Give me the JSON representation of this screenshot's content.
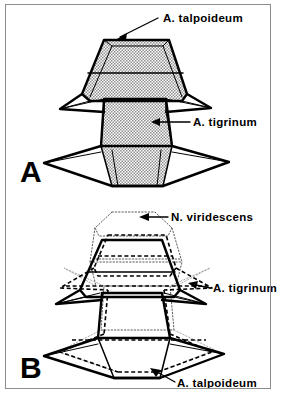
{
  "figure": {
    "title_visible": false,
    "background_color": "#ffffff",
    "ink_color": "#000000",
    "frame_color": "#8c8c8c",
    "shade_fill": "#b9b9b9"
  },
  "panels": [
    {
      "id": "A",
      "letter": "A",
      "description": "Shaded three-dimensional polyhedral niche volumes",
      "labels": [
        {
          "name": "a-talpoideum",
          "text": "A. talpoideum",
          "x": 163,
          "y": 22,
          "anchor": "start",
          "leader_from": [
            158,
            18
          ],
          "leader_to": [
            118,
            38
          ]
        },
        {
          "name": "a-tigrinum",
          "text": "A. tigrinum",
          "x": 193,
          "y": 126,
          "anchor": "start",
          "leader_from": [
            190,
            122
          ],
          "leader_to": [
            152,
            122
          ]
        }
      ]
    },
    {
      "id": "B",
      "letter": "B",
      "description": "Overlapping wireframe niche volumes drawn in solid, dashed and dotted line styles",
      "labels": [
        {
          "name": "n-viridescens",
          "text": "N. viridescens",
          "x": 171,
          "y": 221,
          "anchor": "start",
          "leader_from": [
            168,
            217
          ],
          "leader_to": [
            140,
            217
          ]
        },
        {
          "name": "a-tigrinum",
          "text": "A. tigrinum",
          "x": 213,
          "y": 292,
          "anchor": "start",
          "leader_from": [
            210,
            288
          ],
          "leader_to": [
            188,
            284
          ]
        },
        {
          "name": "a-talpoideum",
          "text": "A. talpoideum",
          "x": 177,
          "y": 387,
          "anchor": "start",
          "leader_from": [
            175,
            382
          ],
          "leader_to": [
            150,
            368
          ]
        }
      ]
    }
  ],
  "legend_line_styles": [
    {
      "name": "solid-heavy",
      "meaning": "A. talpoideum / foreground polygon edges"
    },
    {
      "name": "dashed",
      "meaning": "A. tigrinum hidden or overlapping edges"
    },
    {
      "name": "dotted",
      "meaning": "N. viridescens volume outline"
    }
  ],
  "species": [
    "A. talpoideum",
    "A. tigrinum",
    "N. viridescens"
  ]
}
